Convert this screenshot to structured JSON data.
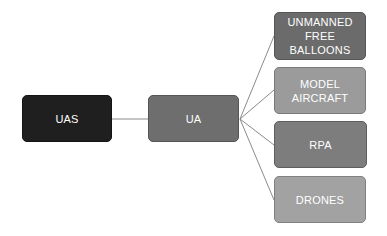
{
  "diagram": {
    "type": "hierarchy",
    "root": {
      "label": "UAS",
      "color": "#1f1f1f",
      "box": {
        "x": 22,
        "y": 95,
        "w": 90,
        "h": 47
      }
    },
    "middle": {
      "label": "UA",
      "color": "#6e6e6e",
      "box": {
        "x": 148,
        "y": 95,
        "w": 91,
        "h": 47
      }
    },
    "children": [
      {
        "label": "UNMANNED FREE BALLOONS",
        "line1": "UNMANNED",
        "line2": "FREE BALLOONS",
        "color": "#6b6b6b",
        "box": {
          "x": 274,
          "y": 12,
          "w": 92,
          "h": 48
        }
      },
      {
        "label": "MODEL AIRCRAFT",
        "line1": "MODEL",
        "line2": "AIRCRAFT",
        "color": "#9b9b9b",
        "box": {
          "x": 274,
          "y": 67,
          "w": 92,
          "h": 47
        }
      },
      {
        "label": "RPA",
        "line1": "RPA",
        "line2": "",
        "color": "#7d7d7d",
        "box": {
          "x": 274,
          "y": 121,
          "w": 93,
          "h": 47
        }
      },
      {
        "label": "DRONES",
        "line1": "DRONES",
        "line2": "",
        "color": "#a2a2a2",
        "box": {
          "x": 274,
          "y": 176,
          "w": 92,
          "h": 47
        }
      }
    ],
    "connector_color": "#8a8a8a",
    "edges": [
      {
        "from": "UAS",
        "to": "UA"
      },
      {
        "from": "UA",
        "to": "UNMANNED FREE BALLOONS"
      },
      {
        "from": "UA",
        "to": "MODEL AIRCRAFT"
      },
      {
        "from": "UA",
        "to": "RPA"
      },
      {
        "from": "UA",
        "to": "DRONES"
      }
    ]
  }
}
